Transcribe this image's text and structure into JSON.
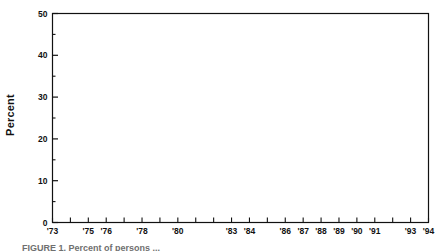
{
  "figure": {
    "caption": "FIGURE 1. Percent of persons ..."
  },
  "axes": {
    "y_title": "Percent",
    "y_ticks_major": [
      "0",
      "10",
      "20",
      "30",
      "40",
      "50"
    ],
    "y_minor_values": [
      5,
      15,
      25,
      35,
      45
    ],
    "y_min": 0,
    "y_max": 50,
    "x_tick_years": [
      73,
      74,
      75,
      76,
      77,
      78,
      79,
      80,
      81,
      82,
      83,
      84,
      85,
      86,
      87,
      88,
      89,
      90,
      91,
      92,
      93,
      94
    ],
    "x_labeled": {
      "73": "'73",
      "75": "'75",
      "76": "'76",
      "78": "'78",
      "80": "'80",
      "83": "'83",
      "84": "'84",
      "86": "'86",
      "87": "'87",
      "88": "'88",
      "89": "'89",
      "90": "'90",
      "91": "'91",
      "93": "'93",
      "94": "'94"
    },
    "axis_color": "#111111",
    "line_color": "#2b2b2b"
  },
  "chart_data": {
    "type": "line",
    "title": "",
    "xlabel": "",
    "ylabel": "Percent",
    "ylim": [
      0,
      50
    ],
    "xlim": [
      1973,
      1994
    ],
    "grid": false,
    "legend": null,
    "categories": [
      "'73",
      "'74",
      "'75",
      "'76",
      "'77",
      "'78",
      "'79",
      "'80",
      "'81",
      "'82",
      "'83",
      "'84",
      "'85",
      "'86",
      "'87",
      "'88",
      "'89",
      "'90",
      "'91",
      "'92",
      "'93",
      "'94"
    ],
    "x": [
      1973,
      1974,
      1975,
      1976,
      1977,
      1978,
      1979,
      1980,
      1981,
      1982,
      1983,
      1984,
      1985,
      1986,
      1987,
      1988,
      1989,
      1990,
      1991,
      1992,
      1993,
      1994
    ],
    "values": [
      19.7,
      20.5,
      21.3,
      28.8,
      29.3,
      30.2,
      28.5,
      26.6,
      24.6,
      22.6,
      21.0,
      23.4,
      21.3,
      19.0,
      16.1,
      17.3,
      16.7,
      16.4,
      17.6,
      19.8,
      23.0,
      23.2
    ],
    "series": [
      {
        "name": "Percent",
        "values": [
          19.7,
          20.5,
          21.3,
          28.8,
          29.3,
          30.2,
          28.5,
          26.6,
          24.6,
          22.6,
          21.0,
          23.4,
          21.3,
          19.0,
          16.1,
          17.3,
          16.7,
          16.4,
          17.6,
          19.8,
          23.0,
          23.2
        ]
      }
    ]
  }
}
